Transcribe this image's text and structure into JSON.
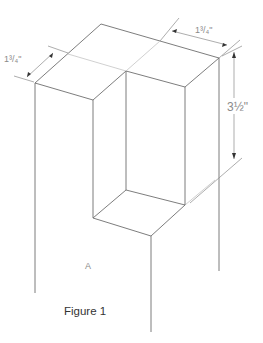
{
  "figure": {
    "caption": "Figure 1",
    "region_label": "A",
    "dimensions": {
      "left_depth": "1³/₄\"",
      "top_width": "1³/₄\"",
      "height": "3½\""
    },
    "colors": {
      "edge": "#6e6e6e",
      "guide": "#c4c4c4",
      "text": "#8a8a8a",
      "caption": "#333333"
    }
  }
}
